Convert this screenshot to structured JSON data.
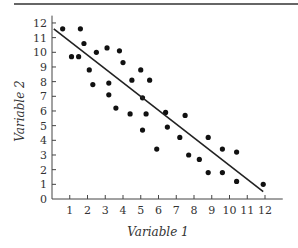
{
  "chart_data": {
    "type": "scatter",
    "title": "",
    "xlabel": "Variable 1",
    "ylabel": "Variable 2",
    "xlim": [
      0,
      13
    ],
    "ylim": [
      0,
      12.5
    ],
    "x_ticks": [
      1,
      2,
      3,
      4,
      5,
      6,
      7,
      8,
      9,
      10,
      11,
      12
    ],
    "y_ticks": [
      0,
      1,
      2,
      3,
      4,
      5,
      6,
      7,
      8,
      9,
      10,
      11,
      12
    ],
    "grid": false,
    "legend": null,
    "series": [
      {
        "name": "observations",
        "points": [
          [
            0.6,
            11.6
          ],
          [
            1.1,
            9.7
          ],
          [
            1.5,
            9.7
          ],
          [
            1.6,
            11.6
          ],
          [
            1.8,
            10.6
          ],
          [
            2.1,
            8.8
          ],
          [
            2.3,
            7.8
          ],
          [
            2.5,
            10.0
          ],
          [
            3.1,
            10.3
          ],
          [
            3.2,
            7.1
          ],
          [
            3.2,
            7.9
          ],
          [
            3.8,
            10.1
          ],
          [
            4.0,
            9.3
          ],
          [
            3.6,
            6.2
          ],
          [
            4.5,
            8.1
          ],
          [
            4.4,
            5.8
          ],
          [
            5.1,
            4.7
          ],
          [
            5.0,
            8.8
          ],
          [
            5.5,
            8.1
          ],
          [
            5.3,
            5.8
          ],
          [
            6.4,
            5.9
          ],
          [
            6.5,
            4.9
          ],
          [
            5.1,
            6.9
          ],
          [
            7.5,
            5.7
          ],
          [
            7.2,
            4.2
          ],
          [
            5.9,
            3.4
          ],
          [
            7.7,
            3.0
          ],
          [
            8.8,
            4.2
          ],
          [
            8.3,
            2.7
          ],
          [
            9.6,
            3.4
          ],
          [
            8.8,
            1.8
          ],
          [
            9.6,
            1.8
          ],
          [
            10.4,
            3.2
          ],
          [
            10.4,
            1.2
          ],
          [
            11.9,
            1.0
          ]
        ]
      }
    ],
    "trendline": {
      "x": [
        0.1,
        11.9
      ],
      "y": [
        11.6,
        0.5
      ]
    }
  }
}
